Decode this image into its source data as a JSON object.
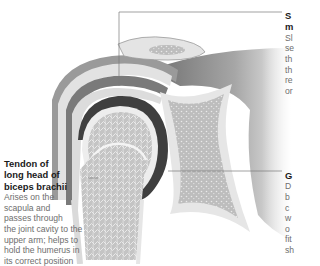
{
  "figure": {
    "labels": {
      "tendon": {
        "title_lines": [
          "Tendon of",
          "long head of",
          "biceps brachii"
        ],
        "body_lines": [
          "Arises on the",
          "scapula and",
          "passes through",
          "the joint cavity to the",
          "upper arm; helps to",
          "hold the humerus in",
          "its correct position"
        ]
      },
      "synovial": {
        "title_lines": [
          "S",
          "m"
        ],
        "body_lines": [
          "Sl",
          "se",
          "th",
          "th",
          "re",
          "or"
        ]
      },
      "glenoid": {
        "title_lines": [
          "G"
        ],
        "body_lines": [
          "D",
          "b",
          "c",
          "w",
          "o",
          "fit",
          "sh"
        ]
      }
    },
    "colors": {
      "background": "#ffffff",
      "bone_spongy": "#c9c9c9",
      "cartilage": "#e8e8e8",
      "joint_cavity": "#4a4a4a",
      "muscle": "#8a8a8a",
      "leader_line": "#7a7a7a",
      "label_title": "#1a1a1a",
      "label_body": "#6e6e6e"
    }
  }
}
